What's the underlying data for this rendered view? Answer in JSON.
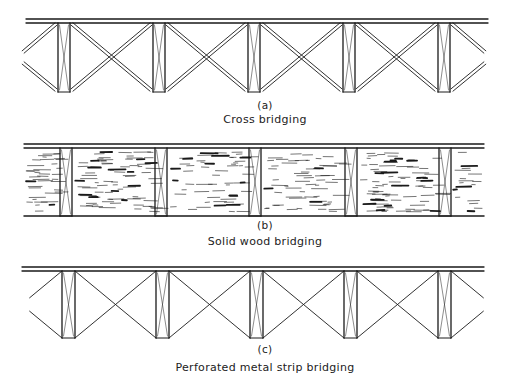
{
  "figure": {
    "stroke_color": "#1a1a1a",
    "panels": [
      {
        "id": "a",
        "letter": "(a)",
        "caption": "Cross bridging",
        "type": "cross",
        "top_y": 19,
        "bottom_y": 92,
        "x_start": 26,
        "x_end": 488,
        "joists_x": [
          58,
          153,
          248,
          343,
          438
        ],
        "joist_width": 12
      },
      {
        "id": "b",
        "letter": "(b)",
        "caption": "Solid wood bridging",
        "type": "solid",
        "top_y": 144,
        "bottom_y": 216,
        "x_start": 24,
        "x_end": 484,
        "joists_x": [
          60,
          155,
          249,
          345,
          439
        ],
        "joist_width": 12
      },
      {
        "id": "c",
        "letter": "(c)",
        "caption": "Perforated metal strip bridging",
        "type": "strip",
        "top_y": 267,
        "bottom_y": 338,
        "x_start": 22,
        "x_end": 484,
        "joists_x": [
          62,
          156,
          250,
          344,
          438
        ],
        "joist_width": 13
      }
    ]
  }
}
